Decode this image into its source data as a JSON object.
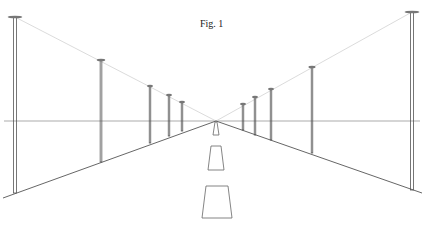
{
  "figure": {
    "title": "Fig. 1",
    "vanishing_point": [
      216,
      121
    ],
    "horizon_y": 121,
    "colors": {
      "lines": "#555555",
      "guides": "#bbbbbb",
      "poles": "#444444"
    },
    "left_poles": [
      {
        "x": 15,
        "top": 17,
        "base": 193
      },
      {
        "x": 101,
        "top": 60,
        "base": 162
      },
      {
        "x": 150,
        "top": 86,
        "base": 143
      },
      {
        "x": 169,
        "top": 95,
        "base": 136
      },
      {
        "x": 182,
        "top": 102,
        "base": 131
      }
    ],
    "right_poles": [
      {
        "x": 243,
        "top": 104,
        "base": 130
      },
      {
        "x": 255,
        "top": 97,
        "base": 135
      },
      {
        "x": 271,
        "top": 89,
        "base": 140
      },
      {
        "x": 312,
        "top": 67,
        "base": 153
      },
      {
        "x": 412,
        "top": 12,
        "base": 190
      }
    ]
  }
}
